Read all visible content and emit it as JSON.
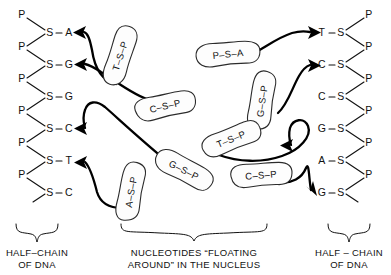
{
  "figure": {
    "background": "#ffffff",
    "ink": "#111111",
    "arrow_color": "#000000",
    "blob_fill": "#fdfdfd"
  },
  "left_chain": {
    "caption_line1": "HALF–CHAIN",
    "caption_line2": "OF DNA",
    "phosphate_label": "P",
    "sugar_label": "S",
    "bases": [
      "A",
      "G",
      "G",
      "C",
      "T",
      "C"
    ],
    "units": [
      {
        "p": "P",
        "s": "S",
        "base": "A",
        "dash": "–"
      },
      {
        "p": "P",
        "s": "S",
        "base": "G",
        "dash": "–"
      },
      {
        "p": "P",
        "s": "S",
        "base": "G",
        "dash": "–"
      },
      {
        "p": "P",
        "s": "S",
        "base": "C",
        "dash": "–"
      },
      {
        "p": "P",
        "s": "S",
        "base": "T",
        "dash": "–"
      },
      {
        "p": "P",
        "s": "S",
        "base": "C",
        "dash": "–"
      }
    ]
  },
  "right_chain": {
    "caption_line1": "HALF – CHAIN",
    "caption_line2": "OF DNA",
    "phosphate_label": "P",
    "sugar_label": "S",
    "bases": [
      "T",
      "C",
      "C",
      "G",
      "A",
      "G"
    ],
    "units": [
      {
        "base": "T",
        "s": "S",
        "p": "P",
        "dash": "–"
      },
      {
        "base": "C",
        "s": "S",
        "p": "P",
        "dash": "–"
      },
      {
        "base": "C",
        "s": "S",
        "p": "P",
        "dash": "–"
      },
      {
        "base": "G",
        "s": "S",
        "p": "P",
        "dash": "–"
      },
      {
        "base": "A",
        "s": "S",
        "p": "P",
        "dash": "–"
      },
      {
        "base": "G",
        "s": "S",
        "p": "P",
        "dash": "–"
      }
    ]
  },
  "middle": {
    "caption_line1": "NUCLEOTIDES “FLOATING",
    "caption_line2": "AROUND” IN THE NUCLEUS"
  },
  "free_nucleotides": [
    {
      "id": "n1",
      "label": "T–S–P",
      "base": "T",
      "sugar": "S",
      "phosphate": "P",
      "x": 120,
      "y": 56,
      "rotation": -72
    },
    {
      "id": "n2",
      "label": "C–S–P",
      "base": "C",
      "sugar": "S",
      "phosphate": "P",
      "x": 165,
      "y": 106,
      "rotation": -13
    },
    {
      "id": "n3",
      "label": "P–S–A",
      "base": "A",
      "sugar": "S",
      "phosphate": "P",
      "x": 228,
      "y": 54,
      "rotation": -6
    },
    {
      "id": "n4",
      "label": "G–S–P",
      "base": "G",
      "sugar": "S",
      "phosphate": "P",
      "x": 262,
      "y": 101,
      "rotation": -82
    },
    {
      "id": "n5",
      "label": "T–S–P",
      "base": "T",
      "sugar": "S",
      "phosphate": "P",
      "x": 231,
      "y": 139,
      "rotation": -22
    },
    {
      "id": "n6",
      "label": "G–S–P",
      "base": "G",
      "sugar": "S",
      "phosphate": "P",
      "x": 184,
      "y": 170,
      "rotation": 27
    },
    {
      "id": "n7",
      "label": "A–S–P",
      "base": "A",
      "sugar": "S",
      "phosphate": "P",
      "x": 131,
      "y": 192,
      "rotation": -80
    },
    {
      "id": "n8",
      "label": "C–S–P",
      "base": "C",
      "sugar": "S",
      "phosphate": "P",
      "x": 261,
      "y": 175,
      "rotation": -5
    }
  ],
  "arrows": [
    {
      "id": "a1",
      "target": "left-S-A",
      "note": "arrow into left chain base A"
    },
    {
      "id": "a2",
      "target": "left-S-G",
      "note": "arrow into left chain base G"
    },
    {
      "id": "a3",
      "target": "left-S-C",
      "note": "arrow into left chain base C"
    },
    {
      "id": "a4",
      "target": "left-S-T",
      "note": "arrow into left chain base T"
    },
    {
      "id": "a5",
      "target": "right-T-S",
      "note": "arrow into right chain base T"
    },
    {
      "id": "a6",
      "target": "right-C-S",
      "note": "arrow into right chain base C"
    },
    {
      "id": "a7",
      "target": "right-middle",
      "note": "leftward arrow in right region"
    },
    {
      "id": "a8",
      "target": "right-G-S",
      "note": "arrow into right chain base G"
    }
  ]
}
